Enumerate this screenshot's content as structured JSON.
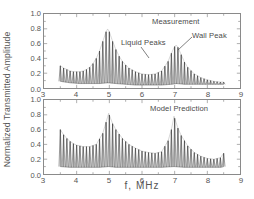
{
  "figure": {
    "xlabel": "f,  MHz",
    "ylabel": "Normalized Transmitted Amplitude"
  },
  "axes": {
    "xticks": [
      "3",
      "4",
      "5",
      "6",
      "7",
      "8",
      "9"
    ],
    "yticks": [
      "1.0",
      "0.8",
      "0.6",
      "0.4",
      "0.2",
      "0.0"
    ]
  },
  "annotations": {
    "measurement": "Measurement",
    "liquid_peaks": "Liquid Peaks",
    "wall_peak": "Wall Peak",
    "model_prediction": "Model Prediction"
  },
  "chart_data": {
    "type": "line",
    "title": "",
    "xlabel": "f,  MHz",
    "ylabel": "Normalized Transmitted Amplitude",
    "xlim": [
      3,
      9
    ],
    "ylim": [
      0.0,
      1.0
    ],
    "xticks": [
      3,
      4,
      5,
      6,
      7,
      8,
      9
    ],
    "yticks": [
      0.0,
      0.2,
      0.4,
      0.6,
      0.8,
      1.0
    ],
    "grid": false,
    "legend": "none",
    "panels": [
      {
        "name": "Measurement",
        "label": "Measurement",
        "data_range_mhz": [
          3.5,
          8.5
        ],
        "comb_spacing_mhz": 0.1,
        "description": "Resonance comb of transmitted amplitude versus frequency; envelope shows two broad resonance peaks (liquid peak near 4.95 MHz and wall peak near 7.05 MHz) plus rising response at the low-frequency edge.",
        "envelope_upper": {
          "x": [
            3.5,
            3.6,
            3.7,
            3.8,
            3.9,
            4.0,
            4.1,
            4.2,
            4.3,
            4.4,
            4.5,
            4.6,
            4.7,
            4.8,
            4.9,
            4.95,
            5.0,
            5.1,
            5.2,
            5.3,
            5.4,
            5.5,
            5.6,
            5.8,
            6.0,
            6.2,
            6.4,
            6.6,
            6.8,
            6.9,
            7.0,
            7.05,
            7.1,
            7.2,
            7.3,
            7.4,
            7.6,
            7.8,
            8.0,
            8.2,
            8.4,
            8.5
          ],
          "y": [
            0.3,
            0.27,
            0.25,
            0.23,
            0.22,
            0.22,
            0.22,
            0.23,
            0.25,
            0.28,
            0.33,
            0.4,
            0.5,
            0.63,
            0.76,
            0.8,
            0.76,
            0.63,
            0.52,
            0.43,
            0.36,
            0.31,
            0.27,
            0.22,
            0.19,
            0.18,
            0.19,
            0.23,
            0.36,
            0.47,
            0.56,
            0.58,
            0.55,
            0.45,
            0.35,
            0.28,
            0.19,
            0.14,
            0.11,
            0.09,
            0.08,
            0.08
          ]
        },
        "envelope_lower": {
          "x": [
            3.5,
            3.8,
            4.1,
            4.4,
            4.7,
            4.95,
            5.2,
            5.5,
            5.8,
            6.2,
            6.6,
            6.9,
            7.05,
            7.3,
            7.6,
            8.0,
            8.4,
            8.5
          ],
          "y": [
            0.09,
            0.07,
            0.06,
            0.06,
            0.06,
            0.07,
            0.06,
            0.05,
            0.04,
            0.04,
            0.04,
            0.05,
            0.06,
            0.05,
            0.05,
            0.05,
            0.05,
            0.05
          ]
        },
        "peaks": [
          {
            "label": "Liquid Peaks",
            "x": 4.95,
            "y": 0.8
          },
          {
            "label": "Wall Peak",
            "x": 7.05,
            "y": 0.58
          }
        ]
      },
      {
        "name": "Model Prediction",
        "label": "Model Prediction",
        "data_range_mhz": [
          3.5,
          8.5
        ],
        "comb_spacing_mhz": 0.1,
        "description": "Modeled resonance comb; broad envelope maxima at 4.98 MHz (0.82) and 6.98 MHz (0.78) with an elevated low-frequency shoulder near 3.5 MHz (0.60).",
        "envelope_upper": {
          "x": [
            3.5,
            3.6,
            3.7,
            3.8,
            3.9,
            4.0,
            4.2,
            4.4,
            4.6,
            4.8,
            4.9,
            4.98,
            5.1,
            5.2,
            5.4,
            5.6,
            5.8,
            6.0,
            6.2,
            6.4,
            6.6,
            6.8,
            6.9,
            6.98,
            7.1,
            7.2,
            7.4,
            7.6,
            7.8,
            8.0,
            8.2,
            8.4,
            8.5
          ],
          "y": [
            0.6,
            0.53,
            0.48,
            0.44,
            0.41,
            0.39,
            0.37,
            0.37,
            0.4,
            0.55,
            0.7,
            0.82,
            0.68,
            0.6,
            0.48,
            0.4,
            0.35,
            0.31,
            0.29,
            0.28,
            0.3,
            0.45,
            0.6,
            0.78,
            0.62,
            0.52,
            0.38,
            0.29,
            0.24,
            0.21,
            0.2,
            0.22,
            0.28
          ]
        },
        "envelope_lower": {
          "x": [
            3.5,
            3.8,
            4.1,
            4.4,
            4.7,
            4.98,
            5.2,
            5.5,
            5.8,
            6.2,
            6.6,
            6.98,
            7.3,
            7.6,
            8.0,
            8.4,
            8.5
          ],
          "y": [
            0.1,
            0.09,
            0.09,
            0.09,
            0.09,
            0.1,
            0.09,
            0.09,
            0.09,
            0.09,
            0.09,
            0.1,
            0.09,
            0.09,
            0.09,
            0.09,
            0.1
          ]
        },
        "peaks": [
          {
            "label": "liquid resonance",
            "x": 4.98,
            "y": 0.82
          },
          {
            "label": "wall resonance",
            "x": 6.98,
            "y": 0.78
          }
        ]
      }
    ]
  }
}
